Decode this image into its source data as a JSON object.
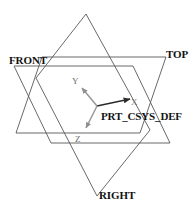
{
  "view": {
    "title": "datum-plane-coordinate-system-view",
    "width": 196,
    "height": 214,
    "background_color": "#ffffff",
    "line_color": "#555555",
    "axis_color": "#7a7a7a",
    "text_color": "#111111"
  },
  "datum_planes": [
    {
      "name": "front-plane",
      "label": "FRONT",
      "label_position": {
        "x": 9,
        "y": 55
      },
      "outline": "14,66 133,66 170,143 51,143",
      "stroke": "#555555"
    },
    {
      "name": "top-plane",
      "label": "TOP",
      "label_position": {
        "x": 166,
        "y": 49
      },
      "outline": "42,57 166,57 140,133 16,133",
      "stroke": "#555555"
    },
    {
      "name": "right-plane",
      "label": "RIGHT",
      "label_position": {
        "x": 99,
        "y": 190
      },
      "outline": "86,14 150,130 97,196 36,78",
      "stroke": "#555555"
    }
  ],
  "coordinate_system": {
    "name": "PRT_CSYS_DEF",
    "label": "PRT_CSYS_DEF",
    "label_position": {
      "x": 101,
      "y": 111
    },
    "origin": {
      "x": 97,
      "y": 106
    },
    "axes": [
      {
        "name": "x-axis",
        "label": "X",
        "tip": {
          "x": 132,
          "y": 99
        },
        "label_position": {
          "x": 131,
          "y": 98
        },
        "color": "#2b2b2b"
      },
      {
        "name": "y-axis",
        "label": "Y",
        "tip": {
          "x": 80,
          "y": 85
        },
        "label_position": {
          "x": 72,
          "y": 77
        },
        "color": "#8a8a8a"
      },
      {
        "name": "z-axis",
        "label": "Z",
        "tip": {
          "x": 84,
          "y": 131
        },
        "label_position": {
          "x": 75,
          "y": 135
        },
        "color": "#8a8a8a"
      }
    ]
  }
}
